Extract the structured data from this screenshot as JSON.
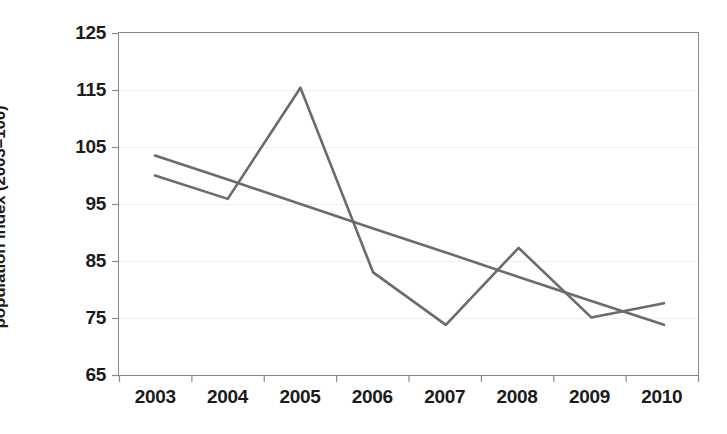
{
  "chart_data": {
    "type": "line",
    "title": "",
    "subtitle": "",
    "xlabel": "",
    "ylabel": "population index (2003=100)",
    "categories": [
      "2003",
      "2004",
      "2005",
      "2006",
      "2007",
      "2008",
      "2009",
      "2010"
    ],
    "x": [
      2003,
      2004,
      2005,
      2006,
      2007,
      2008,
      2009,
      2010
    ],
    "series": [
      {
        "name": "population index",
        "role": "data",
        "color": "#6b6b6b",
        "values": [
          100.0,
          95.9,
          115.4,
          83.0,
          73.8,
          87.3,
          75.1,
          77.6
        ]
      },
      {
        "name": "linear trend",
        "role": "trendline",
        "color": "#6b6b6b",
        "values": [
          103.5,
          99.3,
          95.0,
          90.7,
          86.5,
          82.2,
          78.0,
          73.8
        ]
      }
    ],
    "ylim": [
      65,
      125
    ],
    "yticks": [
      65,
      75,
      85,
      95,
      105,
      115,
      125
    ],
    "ytick_labels": [
      "65",
      "75",
      "85",
      "95",
      "105",
      "115",
      "125"
    ],
    "xlim": [
      2003,
      2010
    ],
    "grid": "horizontal-faint",
    "legend": "none",
    "axis_color": "#8a8a8a",
    "text_color": "#1b1b1b",
    "background": "#ffffff"
  },
  "axes": {
    "y_title": "population index (2003=100)",
    "y_ticks": [
      {
        "label": "125",
        "value": 125
      },
      {
        "label": "115",
        "value": 115
      },
      {
        "label": "105",
        "value": 105
      },
      {
        "label": "95",
        "value": 95
      },
      {
        "label": "85",
        "value": 85
      },
      {
        "label": "75",
        "value": 75
      },
      {
        "label": "65",
        "value": 65
      }
    ],
    "x_ticks": [
      {
        "label": "2003"
      },
      {
        "label": "2004"
      },
      {
        "label": "2005"
      },
      {
        "label": "2006"
      },
      {
        "label": "2007"
      },
      {
        "label": "2008"
      },
      {
        "label": "2009"
      },
      {
        "label": "2010"
      }
    ]
  }
}
